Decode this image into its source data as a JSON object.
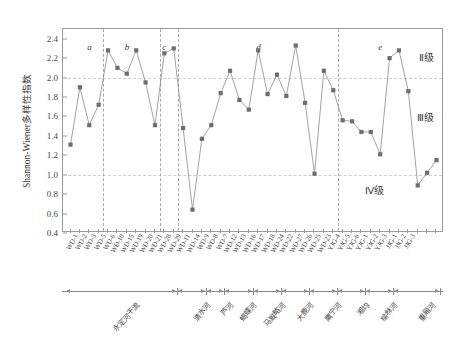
{
  "chart_data": {
    "type": "line",
    "title": "",
    "xlabel": "",
    "ylabel": "Shannon-Wiener多样性指数",
    "ylim": [
      0.4,
      2.5
    ],
    "yticks": [
      0.4,
      0.6,
      0.8,
      1.0,
      1.2,
      1.4,
      1.6,
      1.8,
      2.0,
      2.2,
      2.4
    ],
    "grid": false,
    "gridlines_h": [
      2.0,
      1.0
    ],
    "legend_position": "inside-right",
    "categories": [
      "WD-1",
      "WD-2",
      "WD-3",
      "WD-5",
      "WD-6",
      "WD-10",
      "WD-15",
      "WD-19",
      "WD-20",
      "WD-21",
      "WD-28",
      "WD-29",
      "WD-11",
      "WD-14",
      "WD-9",
      "WD-8",
      "WD-7",
      "WD-12",
      "WD-13",
      "WD-16",
      "WD-17",
      "WD-18",
      "WD-24",
      "WD-22",
      "WD-27",
      "WD-26",
      "WD-25",
      "WD-23",
      "YJG-4",
      "YJG-5",
      "YJG-6",
      "YJG-1",
      "YJG-2",
      "YJG-3",
      "JJG-1",
      "JJG-2",
      "JJG-3"
    ],
    "values": [
      1.31,
      1.9,
      1.51,
      1.72,
      2.28,
      2.1,
      2.04,
      2.28,
      1.95,
      1.51,
      2.25,
      2.3,
      1.48,
      0.64,
      1.37,
      1.51,
      1.84,
      2.07,
      1.77,
      1.67,
      2.28,
      1.83,
      2.03,
      1.81,
      2.33,
      1.74,
      1.01,
      2.07,
      1.87,
      1.56,
      1.55,
      1.44,
      1.44,
      1.21,
      2.2,
      2.28,
      1.86
    ],
    "values_tail": [
      0.89,
      1.02,
      1.15
    ],
    "annotations": [
      {
        "label": "a",
        "x_index": 2
      },
      {
        "label": "b",
        "x_index": 6
      },
      {
        "label": "c",
        "x_index": 10
      },
      {
        "label": "d",
        "x_index": 20
      },
      {
        "label": "e",
        "x_index": 33
      }
    ],
    "dividers_after_index": [
      3,
      9,
      11,
      28
    ],
    "grade_labels": [
      {
        "text": "Ⅱ级",
        "value": 2.22
      },
      {
        "text": "Ⅲ级",
        "value": 1.6
      },
      {
        "text": "Ⅳ级",
        "value": 0.85
      }
    ]
  },
  "axis": {
    "y_title": "Shannon-Wiener多样性指数",
    "y_ticks": [
      "2.4",
      "2.2",
      "2.0",
      "1.8",
      "1.6",
      "1.4",
      "1.2",
      "1.0",
      "0.8",
      "0.6",
      "0.4"
    ]
  },
  "x_labels": [
    "WD-1",
    "WD-2",
    "WD-3",
    "WD-5",
    "WD-6",
    "WD-10",
    "WD-15",
    "WD-19",
    "WD-20",
    "WD-21",
    "WD-28",
    "WD-29",
    "WD-11",
    "WD-14",
    "WD-9",
    "WD-8",
    "WD-7",
    "WD-12",
    "WD-13",
    "WD-16",
    "WD-17",
    "WD-18",
    "WD-24",
    "WD-22",
    "WD-27",
    "WD-26",
    "WD-25",
    "WD-23",
    "YJG-4",
    "YJG-5",
    "YJG-6",
    "YJG-1",
    "YJG-2",
    "YJG-3",
    "JJG-1",
    "JJG-2",
    "JJG-3"
  ],
  "segment_letters": [
    "a",
    "b",
    "c",
    "d",
    "e"
  ],
  "grades": [
    "Ⅱ级",
    "Ⅲ级",
    "Ⅳ级"
  ],
  "river_groups": [
    {
      "label": "永定河干流",
      "start": 0,
      "end": 11
    },
    {
      "label": "清水河",
      "start": 12,
      "end": 14
    },
    {
      "label": "芦河",
      "start": 15,
      "end": 16
    },
    {
      "label": "蝎蝶河",
      "start": 17,
      "end": 19
    },
    {
      "label": "马厩略河",
      "start": 20,
      "end": 22
    },
    {
      "label": "大鹿河",
      "start": 23,
      "end": 25
    },
    {
      "label": "鹰宁河",
      "start": 26,
      "end": 28
    },
    {
      "label": "湘均",
      "start": 29,
      "end": 31
    },
    {
      "label": "榆林河",
      "start": 32,
      "end": 34
    },
    {
      "label": "重厢河",
      "start": 35,
      "end": 39
    }
  ],
  "colors": {
    "line": "#8c8c8c",
    "marker": "#6e6e6e",
    "axis": "#9a9a9a",
    "grid": "#d9c9cf",
    "divider": "#a8a8a8",
    "text": "#3a3a3a"
  }
}
